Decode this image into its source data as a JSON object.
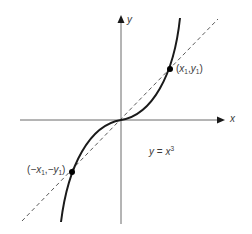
{
  "figure": {
    "function_label": {
      "lhs": "y",
      "eq": " = ",
      "base": "x",
      "exp": "3"
    },
    "axes": {
      "x_label": "x",
      "y_label": "y"
    },
    "points": [
      {
        "name": "p1",
        "x": "x",
        "x_sub": "1",
        "y": "y",
        "y_sub": "1",
        "open": "(",
        "comma": ",",
        "close": ")"
      },
      {
        "name": "p2",
        "x": "−x",
        "x_sub": "1",
        "y": "−y",
        "y_sub": "1",
        "open": "(",
        "comma": ",",
        "close": ")"
      }
    ],
    "colors": {
      "curve": "#1a1a1a",
      "axis": "#6a6a6a",
      "dashed": "#5a5a5a",
      "text": "#3a3a3a"
    }
  }
}
